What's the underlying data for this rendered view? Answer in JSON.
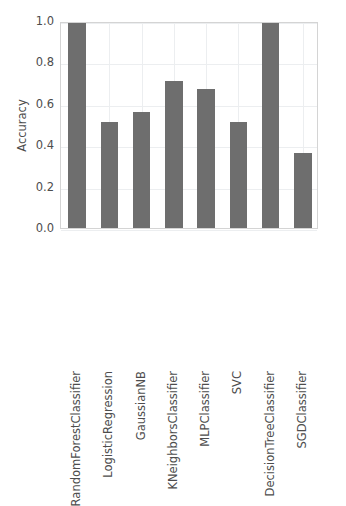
{
  "chart_data": {
    "type": "bar",
    "title": "",
    "xlabel": "",
    "ylabel": "Accuracy",
    "ylim": [
      0.0,
      1.0
    ],
    "yticks": [
      "1.0",
      "0.8",
      "0.6",
      "0.4",
      "0.2",
      "0.0"
    ],
    "ytick_values": [
      1.0,
      0.8,
      0.6,
      0.4,
      0.2,
      0.0
    ],
    "grid": true,
    "legend": null,
    "categories": [
      "RandomForestClassifier",
      "LogisticRegression",
      "GaussianNB",
      "KNeighborsClassifier",
      "MLPClassifier",
      "SVC",
      "DecisionTreeClassifier",
      "SGDClassifier"
    ],
    "values": [
      0.99,
      0.51,
      0.56,
      0.71,
      0.67,
      0.51,
      0.99,
      0.36
    ],
    "bar_color": "#6e6e6e",
    "grid_color": "#eceef0",
    "axis_color": "#d4d4d4",
    "text_color": "#4d4d4d",
    "background": "#ffffff"
  }
}
